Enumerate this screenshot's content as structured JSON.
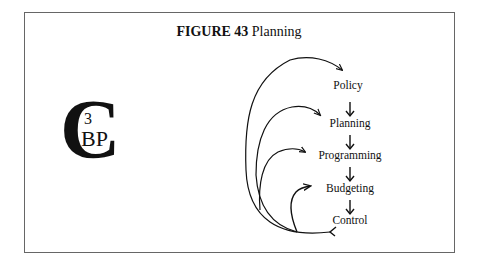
{
  "figure": {
    "number_label": "FIGURE 43",
    "title": "Planning"
  },
  "logo": {
    "big_letter": "C",
    "superscript": "3",
    "letters": "BP",
    "meaning": "C3BP monogram"
  },
  "flow": {
    "stages": [
      {
        "label": "Policy"
      },
      {
        "label": "Planning"
      },
      {
        "label": "Programming"
      },
      {
        "label": "Budgeting"
      },
      {
        "label": "Control"
      }
    ],
    "feedback_loops": [
      {
        "from": "Control",
        "to": "Policy"
      },
      {
        "from": "Control",
        "to": "Planning"
      },
      {
        "from": "Control",
        "to": "Programming"
      },
      {
        "from": "Control",
        "to": "Budgeting"
      }
    ]
  },
  "colors": {
    "ink": "#111111",
    "frame": "#666666",
    "background": "#ffffff"
  }
}
